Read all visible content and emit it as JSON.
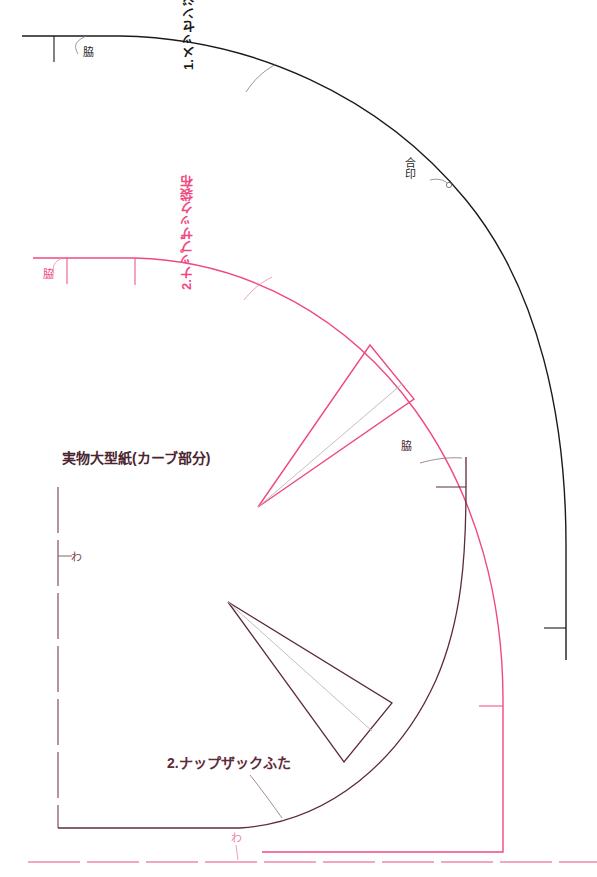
{
  "document": {
    "type": "full-size-sewing-pattern",
    "title": "実物大型紙(カーブ部分)",
    "background_color": "#ffffff"
  },
  "colors": {
    "black": "#1a1a1a",
    "pink": "#ef4a7f",
    "maroon": "#5e2b38",
    "gray_guide": "#bfb6b8"
  },
  "pieces": [
    {
      "id": "messenger-bag-body",
      "label": "1.メッセンジャーバッグ袋布",
      "color": "#1a1a1a",
      "side_label": "脇",
      "notch_label": "合印"
    },
    {
      "id": "knapsack-body",
      "label": "2.ナップザック袋布",
      "color": "#ef4a7f",
      "side_label": "脇",
      "fold_label": "わ"
    },
    {
      "id": "knapsack-flap",
      "label": "2.ナップザックふた",
      "color": "#5e2b38",
      "side_label": "脇",
      "fold_label": "わ"
    }
  ],
  "labels": {
    "title": "実物大型紙(カーブ部分)",
    "piece1_name": "1.メッセンジャーバッグ袋布",
    "piece2_name": "2.ナップザック袋布",
    "piece3_name": "2.ナップザックふた",
    "side_black": "脇",
    "side_pink": "脇",
    "side_maroon": "脇",
    "notch_black": "合印",
    "fold_left": "わ",
    "fold_bottom": "わ"
  }
}
